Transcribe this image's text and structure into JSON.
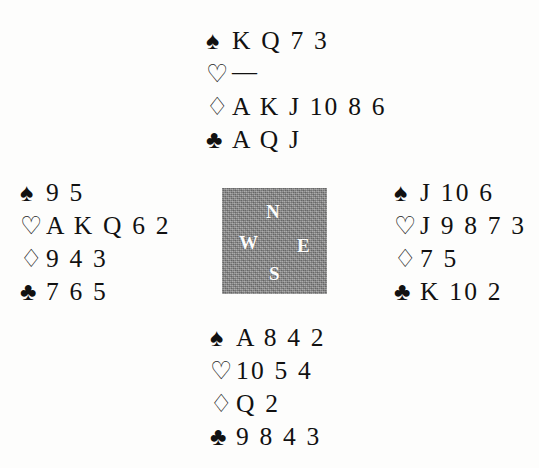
{
  "diagram": {
    "type": "bridge-deal",
    "suit_glyphs": {
      "spades": "♠",
      "hearts": "♡",
      "diamonds": "♢",
      "clubs": "♣"
    },
    "void_mark": "—",
    "colors": {
      "ink": "#111111",
      "page": "#fdfdfc",
      "compass_fill": "#8d8d8d",
      "compass_text": "#fdfdfd"
    },
    "compass": {
      "north": "N",
      "west": "W",
      "east": "E",
      "south": "S"
    },
    "hands": {
      "north": {
        "position_label": "N",
        "spades": "K Q 7 3",
        "hearts": "—",
        "diamonds": "A K J 10 8 6",
        "clubs": "A Q J"
      },
      "west": {
        "position_label": "W",
        "spades": "9 5",
        "hearts": "A K Q 6 2",
        "diamonds": "9 4 3",
        "clubs": "7 6 5"
      },
      "east": {
        "position_label": "E",
        "spades": "J 10 6",
        "hearts": "J 9 8 7 3",
        "diamonds": "7 5",
        "clubs": "K 10 2"
      },
      "south": {
        "position_label": "S",
        "spades": "A 8 4 2",
        "hearts": "10 5 4",
        "diamonds": "Q 2",
        "clubs": "9 8 4 3"
      }
    }
  }
}
